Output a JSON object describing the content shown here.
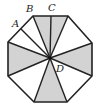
{
  "figure": {
    "type": "octagon-sector-diagram",
    "center": {
      "label": "D",
      "x": 50,
      "y": 58
    },
    "octagon_vertices": [
      [
        33,
        16
      ],
      [
        68,
        16
      ],
      [
        92,
        43
      ],
      [
        92,
        76
      ],
      [
        67,
        102
      ],
      [
        34,
        102
      ],
      [
        8,
        76
      ],
      [
        8,
        42
      ]
    ],
    "points": {
      "A": {
        "x": 21,
        "y": 29
      },
      "B": {
        "x": 33,
        "y": 16
      },
      "C": {
        "x": 51,
        "y": 16
      }
    },
    "labels": [
      {
        "text": "A",
        "x": 12,
        "y": 27
      },
      {
        "text": "B",
        "x": 26,
        "y": 12
      },
      {
        "text": "C",
        "x": 48,
        "y": 11
      },
      {
        "text": "D",
        "x": 56,
        "y": 72
      }
    ],
    "shaded_triangles": [
      [
        [
          50,
          58
        ],
        [
          33,
          16
        ],
        [
          51,
          16
        ]
      ],
      [
        [
          50,
          58
        ],
        [
          51,
          16
        ],
        [
          68,
          16
        ]
      ],
      [
        [
          50,
          58
        ],
        [
          92,
          43
        ],
        [
          92,
          76
        ]
      ],
      [
        [
          50,
          58
        ],
        [
          67,
          102
        ],
        [
          34,
          102
        ]
      ],
      [
        [
          50,
          58
        ],
        [
          8,
          76
        ],
        [
          8,
          42
        ]
      ]
    ],
    "rays": [
      [
        21,
        29
      ],
      [
        33,
        16
      ],
      [
        51,
        16
      ],
      [
        68,
        16
      ],
      [
        92,
        43
      ],
      [
        92,
        76
      ],
      [
        67,
        102
      ],
      [
        34,
        102
      ],
      [
        8,
        76
      ],
      [
        8,
        42
      ]
    ],
    "colors": {
      "shade": "#d3d3d3",
      "line": "#222222",
      "background": "#ffffff"
    }
  }
}
